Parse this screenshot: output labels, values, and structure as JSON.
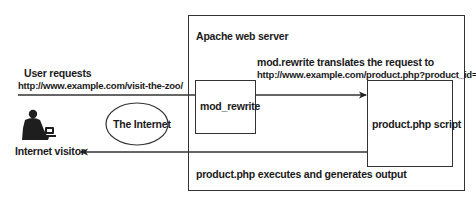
{
  "diagram": {
    "server": {
      "label": "Apache web server"
    },
    "request": {
      "line1": "User requests",
      "line2": "http://www.example.com/visit-the-zoo/"
    },
    "translation": {
      "line1": "mod.rewrite translates the request to",
      "line2": "http://www.example.com/product.php?product_id=36"
    },
    "mod_rewrite_box": {
      "label": "mod_rewrite"
    },
    "product_box": {
      "label": "product.php script"
    },
    "internet": {
      "label": "The Internet"
    },
    "visitor": {
      "label": "Internet visitor",
      "icon": "person-at-computer-icon"
    },
    "output": {
      "label": "product.php executes and generates output"
    },
    "colors": {
      "line": "#333333",
      "text": "#1a1a1a",
      "background": "#ffffff"
    }
  }
}
